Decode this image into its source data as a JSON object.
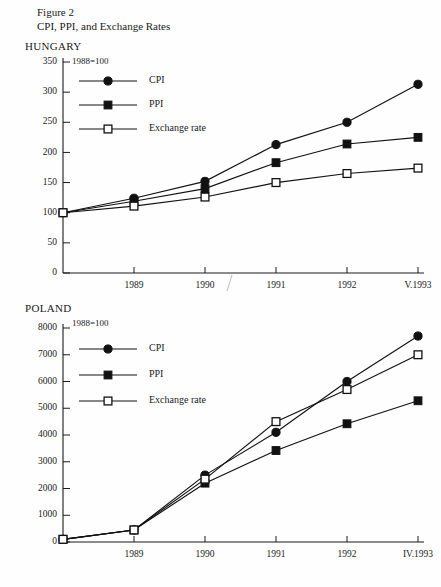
{
  "figure": {
    "label": "Figure 2",
    "title": "CPI, PPI, and Exchange Rates"
  },
  "legend": {
    "cpi": "CPI",
    "ppi": "PPI",
    "exchange": "Exchange rate"
  },
  "panels": [
    {
      "name": "HUNGARY",
      "base_note": "1988=100",
      "ytick_labels": [
        "0",
        "50",
        "100",
        "150",
        "200",
        "250",
        "300",
        "350"
      ],
      "xtick_labels": [
        "1989",
        "1990",
        "1991",
        "1992",
        "V.1993"
      ]
    },
    {
      "name": "POLAND",
      "base_note": "1988=100",
      "ytick_labels": [
        "0",
        "1000",
        "2000",
        "3000",
        "4000",
        "5000",
        "6000",
        "7000",
        "8000"
      ],
      "xtick_labels": [
        "1989",
        "1990",
        "1991",
        "1992",
        "IV.1993"
      ]
    }
  ],
  "chart_data": [
    {
      "type": "line",
      "title": "HUNGARY",
      "subtitle": "1988=100",
      "xlabel": "",
      "ylabel": "",
      "x": [
        "1988",
        "1989",
        "1990",
        "1991",
        "1992",
        "V.1993"
      ],
      "categories": [
        "1988",
        "1989",
        "1990",
        "1991",
        "1992",
        "V.1993"
      ],
      "xtick_labels": [
        "1989",
        "1990",
        "1991",
        "1992",
        "V.1993"
      ],
      "ylim": [
        0,
        350
      ],
      "yticks": [
        0,
        50,
        100,
        150,
        200,
        250,
        300,
        350
      ],
      "grid": false,
      "legend_position": "top-left inside",
      "series": [
        {
          "name": "CPI",
          "marker": "filled-circle",
          "values": [
            100,
            124,
            152,
            213,
            250,
            313
          ]
        },
        {
          "name": "PPI",
          "marker": "filled-square",
          "values": [
            100,
            119,
            140,
            183,
            214,
            225
          ]
        },
        {
          "name": "Exchange rate",
          "marker": "open-square",
          "values": [
            100,
            111,
            126,
            150,
            165,
            174
          ]
        }
      ]
    },
    {
      "type": "line",
      "title": "POLAND",
      "subtitle": "1988=100",
      "xlabel": "",
      "ylabel": "",
      "x": [
        "1988",
        "1989",
        "1990",
        "1991",
        "1992",
        "IV.1993"
      ],
      "categories": [
        "1988",
        "1989",
        "1990",
        "1991",
        "1992",
        "IV.1993"
      ],
      "xtick_labels": [
        "1989",
        "1990",
        "1991",
        "1992",
        "IV.1993"
      ],
      "ylim": [
        0,
        8000
      ],
      "yticks": [
        0,
        1000,
        2000,
        3000,
        4000,
        5000,
        6000,
        7000,
        8000
      ],
      "grid": false,
      "legend_position": "top-left inside",
      "series": [
        {
          "name": "CPI",
          "marker": "filled-circle",
          "values": [
            100,
            450,
            2500,
            4100,
            6000,
            7700
          ]
        },
        {
          "name": "PPI",
          "marker": "filled-square",
          "values": [
            100,
            450,
            2200,
            3420,
            4420,
            5280
          ]
        },
        {
          "name": "Exchange rate",
          "marker": "open-square",
          "values": [
            100,
            450,
            2350,
            4500,
            5700,
            7000
          ]
        }
      ]
    }
  ]
}
